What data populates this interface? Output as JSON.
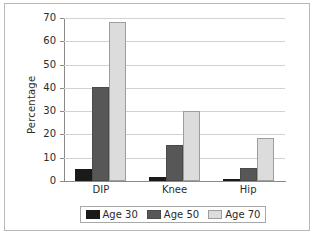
{
  "chart_data": {
    "type": "bar",
    "title": "",
    "subtitle": "",
    "xlabel": "",
    "ylabel": "Percentage",
    "categories": [
      "DIP",
      "Knee",
      "Hip"
    ],
    "series": [
      {
        "name": "Age 30",
        "color": "#1a1a1a",
        "values": [
          5.2,
          1.8,
          1.0
        ]
      },
      {
        "name": "Age 50",
        "color": "#575757",
        "values": [
          40.2,
          15.3,
          5.5
        ]
      },
      {
        "name": "Age 70",
        "color": "#dcdcdc",
        "values": [
          68.5,
          30.2,
          18.3
        ]
      }
    ],
    "ylim": [
      0,
      70
    ],
    "yticks": [
      0,
      10,
      20,
      30,
      40,
      50,
      60,
      70
    ],
    "ytick_labels": [
      "0",
      "10",
      "20",
      "30",
      "40",
      "50",
      "60",
      "70"
    ],
    "grid": true,
    "grid_axis": "y",
    "legend_position": "bottom",
    "axis_color": "#8a8a8a",
    "grid_color": "#d2d2d2",
    "frame_color": "#b9b9b9",
    "background": "#ffffff"
  }
}
